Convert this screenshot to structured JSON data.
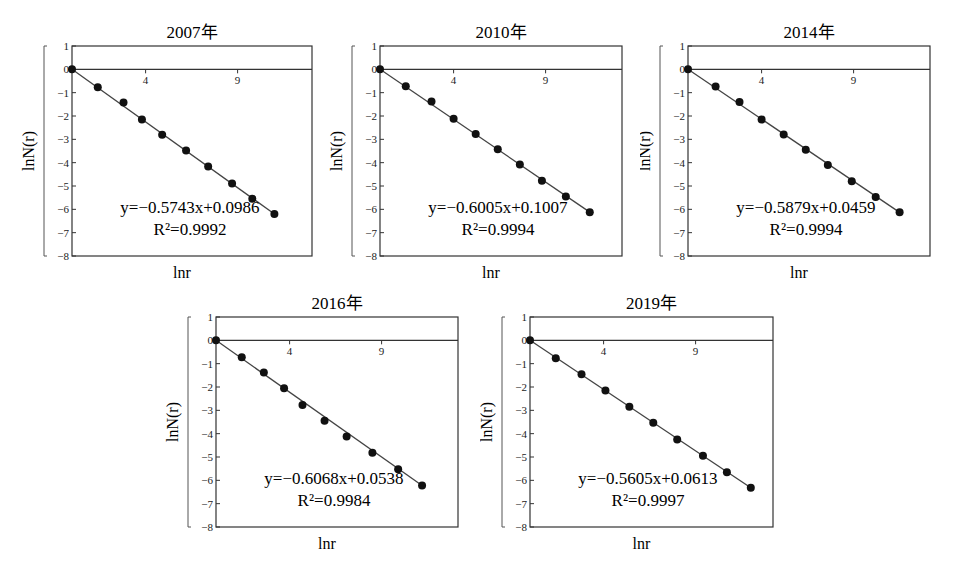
{
  "chart_data": [
    {
      "type": "scatter",
      "title": "2007年",
      "xlabel": "lnr",
      "ylabel": "lnN(r)",
      "ylim": [
        -8,
        1
      ],
      "xlim": [
        0,
        13
      ],
      "x_ticks": [
        4,
        9
      ],
      "y_ticks": [
        1,
        0,
        -1,
        -2,
        -3,
        -4,
        -5,
        -6,
        -7,
        -8
      ],
      "grid": false,
      "series": [
        {
          "name": "points",
          "x": [
            0,
            1.4,
            2.8,
            3.8,
            4.9,
            6.2,
            7.4,
            8.7,
            9.8,
            11.0
          ],
          "y": [
            0,
            -0.77,
            -1.42,
            -2.15,
            -2.8,
            -3.48,
            -4.16,
            -4.89,
            -5.55,
            -6.2
          ]
        }
      ],
      "fit": {
        "slope": -0.5743,
        "intercept": 0.0986,
        "equation": "y=−0.5743x+0.0986",
        "r2_label": "R²=0.9992",
        "r2": 0.9992
      }
    },
    {
      "type": "scatter",
      "title": "2010年",
      "xlabel": "lnr",
      "ylabel": "lnN(r)",
      "ylim": [
        -8,
        1
      ],
      "xlim": [
        0,
        13
      ],
      "x_ticks": [
        4,
        9
      ],
      "y_ticks": [
        1,
        0,
        -1,
        -2,
        -3,
        -4,
        -5,
        -6,
        -7,
        -8
      ],
      "grid": false,
      "series": [
        {
          "name": "points",
          "x": [
            0,
            1.4,
            2.8,
            4.0,
            5.2,
            6.4,
            7.6,
            8.8,
            10.1,
            11.4
          ],
          "y": [
            0,
            -0.72,
            -1.38,
            -2.12,
            -2.77,
            -3.42,
            -4.08,
            -4.78,
            -5.45,
            -6.12
          ]
        }
      ],
      "fit": {
        "slope": -0.6005,
        "intercept": 0.1007,
        "equation": "y=−0.6005x+0.1007",
        "r2_label": "R²=0.9994",
        "r2": 0.9994
      }
    },
    {
      "type": "scatter",
      "title": "2014年",
      "xlabel": "lnr",
      "ylabel": "lnN(r)",
      "ylim": [
        -8,
        1
      ],
      "xlim": [
        0,
        13
      ],
      "x_ticks": [
        4,
        9
      ],
      "y_ticks": [
        1,
        0,
        -1,
        -2,
        -3,
        -4,
        -5,
        -6,
        -7,
        -8
      ],
      "grid": false,
      "series": [
        {
          "name": "points",
          "x": [
            0,
            1.5,
            2.8,
            4.0,
            5.2,
            6.4,
            7.6,
            8.9,
            10.2,
            11.5
          ],
          "y": [
            0,
            -0.74,
            -1.4,
            -2.15,
            -2.79,
            -3.45,
            -4.1,
            -4.8,
            -5.47,
            -6.13
          ]
        }
      ],
      "fit": {
        "slope": -0.5879,
        "intercept": 0.0459,
        "equation": "y=−0.5879x+0.0459",
        "r2_label": "R²=0.9994",
        "r2": 0.9994
      }
    },
    {
      "type": "scatter",
      "title": "2016年",
      "xlabel": "lnr",
      "ylabel": "lnN(r)",
      "ylim": [
        -8,
        1
      ],
      "xlim": [
        0,
        13
      ],
      "x_ticks": [
        4,
        9
      ],
      "y_ticks": [
        1,
        0,
        -1,
        -2,
        -3,
        -4,
        -5,
        -6,
        -7,
        -8
      ],
      "grid": false,
      "series": [
        {
          "name": "points",
          "x": [
            0,
            1.4,
            2.6,
            3.7,
            4.7,
            5.9,
            7.1,
            8.5,
            9.9,
            11.2
          ],
          "y": [
            0,
            -0.72,
            -1.38,
            -2.05,
            -2.77,
            -3.45,
            -4.12,
            -4.82,
            -5.52,
            -6.22
          ]
        }
      ],
      "fit": {
        "slope": -0.6068,
        "intercept": 0.0538,
        "equation": "y=−0.6068x+0.0538",
        "r2_label": "R²=0.9984",
        "r2": 0.9984
      }
    },
    {
      "type": "scatter",
      "title": "2019年",
      "xlabel": "lnr",
      "ylabel": "lnN(r)",
      "ylim": [
        -8,
        1
      ],
      "xlim": [
        0,
        13
      ],
      "x_ticks": [
        4,
        9
      ],
      "y_ticks": [
        1,
        0,
        -1,
        -2,
        -3,
        -4,
        -5,
        -6,
        -7,
        -8
      ],
      "grid": false,
      "series": [
        {
          "name": "points",
          "x": [
            0,
            1.4,
            2.8,
            4.1,
            5.4,
            6.7,
            8.0,
            9.4,
            10.7,
            12.0
          ],
          "y": [
            0,
            -0.77,
            -1.45,
            -2.15,
            -2.85,
            -3.53,
            -4.25,
            -4.95,
            -5.65,
            -6.32
          ]
        }
      ],
      "fit": {
        "slope": -0.5605,
        "intercept": 0.0613,
        "equation": "y=−0.5605x+0.0613",
        "r2_label": "R²=0.9997",
        "r2": 0.9997
      }
    }
  ],
  "panels": [
    {
      "title": "2007年",
      "equation": "y=−0.5743x+0.0986",
      "r2": "R²=0.9992"
    },
    {
      "title": "2010年",
      "equation": "y=−0.6005x+0.1007",
      "r2": "R²=0.9994"
    },
    {
      "title": "2014年",
      "equation": "y=−0.5879x+0.0459",
      "r2": "R²=0.9994"
    },
    {
      "title": "2016年",
      "equation": "y=−0.6068x+0.0538",
      "r2": "R²=0.9984"
    },
    {
      "title": "2019年",
      "equation": "y=−0.5605x+0.0613",
      "r2": "R²=0.9997"
    }
  ],
  "axes": {
    "xlabel": "lnr",
    "ylabel": "lnN(r)"
  }
}
